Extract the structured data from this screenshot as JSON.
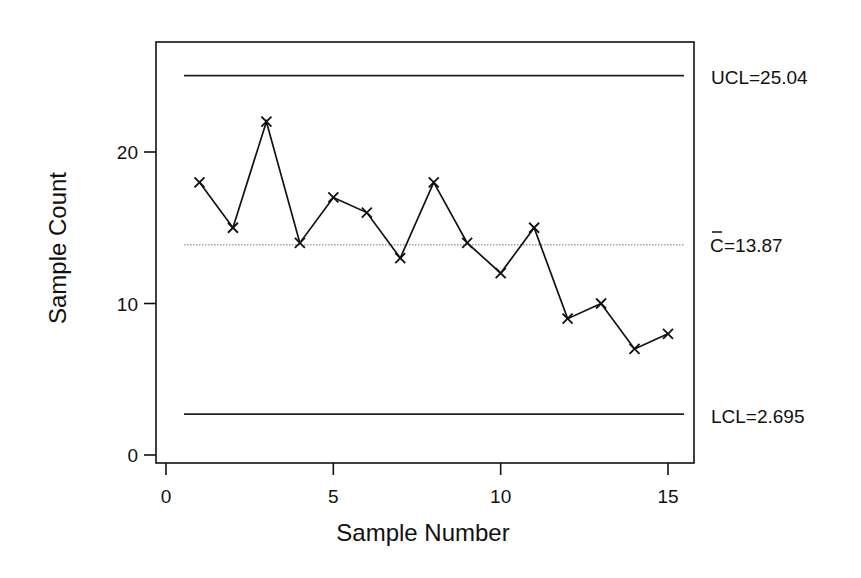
{
  "chart_data": {
    "type": "line",
    "title": "",
    "chart_kind": "c-chart (control chart)",
    "xlabel": "Sample Number",
    "ylabel": "Sample Count",
    "x": [
      1,
      2,
      3,
      4,
      5,
      6,
      7,
      8,
      9,
      10,
      11,
      12,
      13,
      14,
      15
    ],
    "series": [
      {
        "name": "Sample Count",
        "marker": "x",
        "values": [
          18,
          15,
          22,
          14,
          17,
          16,
          13,
          18,
          14,
          12,
          15,
          9,
          10,
          7,
          8
        ]
      }
    ],
    "control_limits": {
      "ucl": 25.04,
      "center": 13.87,
      "lcl": 2.695
    },
    "limit_labels": {
      "ucl": "UCL=25.04",
      "center_symbol": "C",
      "center_value": "=13.87",
      "lcl": "LCL=2.695"
    },
    "x_ticks": [
      "0",
      "5",
      "10",
      "15"
    ],
    "x_tick_values": [
      0,
      5,
      10,
      15
    ],
    "y_ticks": [
      "0",
      "10",
      "20"
    ],
    "y_tick_values": [
      0,
      10,
      20
    ],
    "xlim": [
      -0.3,
      15.8
    ],
    "ylim": [
      -0.5,
      27.2
    ],
    "grid": false,
    "legend": "none",
    "colors": {
      "line": "#111111",
      "center_line": "#777777",
      "limit_lines": "#222222",
      "frame": "#111111"
    }
  }
}
